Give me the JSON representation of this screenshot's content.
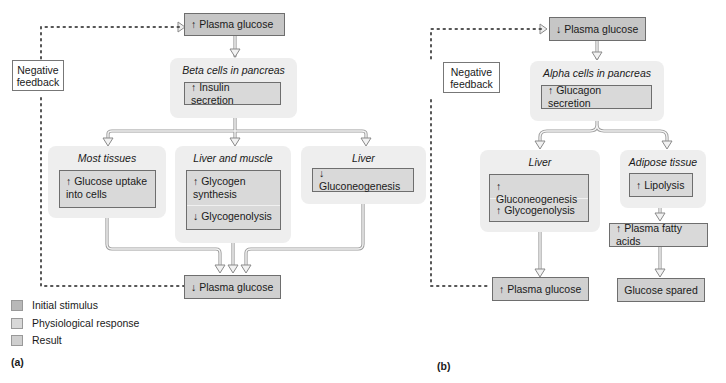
{
  "colors": {
    "initial_stimulus": "#c6c6c6",
    "physiological_response": "#d9d9d9",
    "result": "#d0d0d0",
    "group_background": "#eeeeee"
  },
  "panel_a": {
    "label": "(a)",
    "top_box": "↑ Plasma glucose",
    "negative_feedback": [
      "Negative",
      "feedback"
    ],
    "pancreas": {
      "title": "Beta cells in pancreas",
      "box": "↑ Insulin secretion"
    },
    "targets": [
      {
        "title": "Most tissues",
        "items": [
          "↑ Glucose uptake into cells"
        ]
      },
      {
        "title": "Liver and muscle",
        "items": [
          "↑ Glycogen synthesis",
          "↓ Glycogenolysis"
        ]
      },
      {
        "title": "Liver",
        "items": [
          "↓ Gluconeogenesis"
        ]
      }
    ],
    "result_box": "↓ Plasma glucose"
  },
  "legend": [
    {
      "label": "Initial stimulus"
    },
    {
      "label": "Physiological response"
    },
    {
      "label": "Result"
    }
  ],
  "panel_b": {
    "label": "(b)",
    "top_box": "↓ Plasma glucose",
    "negative_feedback": [
      "Negative",
      "feedback"
    ],
    "pancreas": {
      "title": "Alpha cells in pancreas",
      "box": "↑ Glucagon secretion"
    },
    "targets": [
      {
        "title": "Liver",
        "items": [
          "↑ Gluconeogenesis",
          "↑ Glycogenolysis"
        ]
      },
      {
        "title": "Adipose tissue",
        "items": [
          "↑ Lipolysis"
        ]
      }
    ],
    "fatty_acids_box": "↑ Plasma fatty acids",
    "result_box": "↑ Plasma glucose",
    "spared_box": "Glucose spared"
  }
}
